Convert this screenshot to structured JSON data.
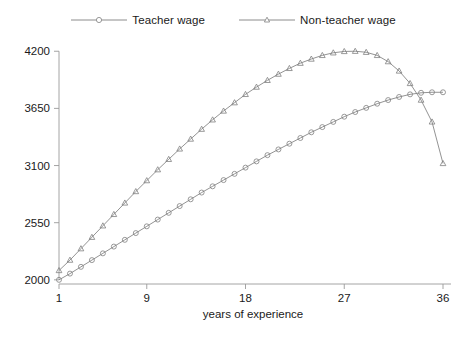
{
  "legend": {
    "position": "top-center",
    "entries": [
      {
        "label": "Teacher wage",
        "marker": "circle-open-marker",
        "color": "#808080"
      },
      {
        "label": "Non-teacher wage",
        "marker": "triangle-open-marker",
        "color": "#808080"
      }
    ]
  },
  "axes": {
    "xlabel": "years of experience",
    "ylabel": "",
    "xticks": [
      1,
      9,
      18,
      27,
      36
    ],
    "yticks": [
      2000,
      2550,
      3100,
      3650,
      4200
    ],
    "xlim": [
      1,
      36
    ],
    "ylim": [
      1960,
      4260
    ],
    "grid": false
  },
  "colors": {
    "line": "#808080",
    "axis": "#9a9a9a",
    "text": "#1a1a1a",
    "background": "#ffffff"
  },
  "chart_data": {
    "type": "line",
    "title": "",
    "subtitle": "",
    "xlabel": "years of experience",
    "ylabel": "",
    "xlim": [
      1,
      36
    ],
    "ylim": [
      1960,
      4260
    ],
    "grid": false,
    "legend_position": "top-center",
    "x": [
      1,
      2,
      3,
      4,
      5,
      6,
      7,
      8,
      9,
      10,
      11,
      12,
      13,
      14,
      15,
      16,
      17,
      18,
      19,
      20,
      21,
      22,
      23,
      24,
      25,
      26,
      27,
      28,
      29,
      30,
      31,
      32,
      33,
      34,
      35,
      36
    ],
    "series": [
      {
        "name": "Teacher wage",
        "marker": "circle-open-marker",
        "color": "#808080",
        "values": [
          2000,
          2060,
          2125,
          2190,
          2255,
          2320,
          2385,
          2450,
          2515,
          2580,
          2645,
          2710,
          2775,
          2840,
          2900,
          2960,
          3020,
          3080,
          3140,
          3200,
          3255,
          3310,
          3365,
          3420,
          3470,
          3520,
          3570,
          3615,
          3655,
          3695,
          3730,
          3760,
          3785,
          3800,
          3805,
          3805
        ]
      },
      {
        "name": "Non-teacher wage",
        "marker": "triangle-open-marker",
        "color": "#808080",
        "values": [
          2090,
          2190,
          2300,
          2410,
          2520,
          2630,
          2740,
          2850,
          2955,
          3060,
          3160,
          3260,
          3355,
          3450,
          3540,
          3625,
          3705,
          3785,
          3855,
          3920,
          3980,
          4035,
          4085,
          4125,
          4160,
          4185,
          4198,
          4200,
          4190,
          4160,
          4100,
          4010,
          3890,
          3730,
          3520,
          3120
        ]
      }
    ]
  },
  "caption": {
    "text": ""
  }
}
